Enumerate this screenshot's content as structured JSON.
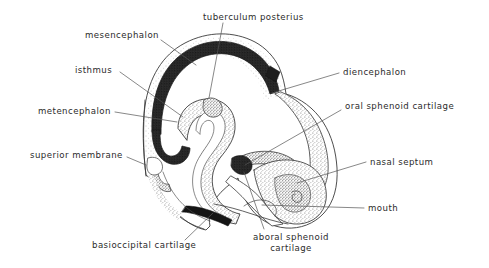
{
  "figure": {
    "background_color": "#ffffff",
    "ink_color": "#2b2b2b",
    "leader_line_color": "#555555"
  },
  "labels": [
    {
      "id": "mesencephalon",
      "text": "mesencephalon",
      "side": "left",
      "x": 85,
      "y": 30,
      "leader": [
        [
          161,
          40
        ],
        [
          196,
          65
        ]
      ]
    },
    {
      "id": "tuberculum-posterius",
      "text": "tuberculum posterius",
      "side": "top",
      "x": 203,
      "y": 12,
      "leader": [
        [
          223,
          23
        ],
        [
          209,
          98
        ]
      ]
    },
    {
      "id": "isthmus",
      "text": "isthmus",
      "side": "left",
      "x": 75,
      "y": 65,
      "leader": [
        [
          120,
          72
        ],
        [
          183,
          117
        ]
      ]
    },
    {
      "id": "diencephalon",
      "text": "diencephalon",
      "side": "right",
      "x": 343,
      "y": 67,
      "leader": [
        [
          339,
          73
        ],
        [
          272,
          93
        ]
      ]
    },
    {
      "id": "metencephalon",
      "text": "metencephalon",
      "side": "left",
      "x": 38,
      "y": 106,
      "leader": [
        [
          115,
          112
        ],
        [
          177,
          122
        ]
      ]
    },
    {
      "id": "oral-sphenoid-cartilage",
      "text": "oral sphenoid cartilage",
      "side": "right",
      "x": 345,
      "y": 101,
      "leader": [
        [
          341,
          110
        ],
        [
          245,
          165
        ]
      ]
    },
    {
      "id": "superior-membrane",
      "text": "superior membrane",
      "side": "left",
      "x": 30,
      "y": 150,
      "leader": [
        [
          127,
          157
        ],
        [
          146,
          165
        ]
      ]
    },
    {
      "id": "nasal-septum",
      "text": "nasal septum",
      "side": "right",
      "x": 370,
      "y": 157,
      "leader": [
        [
          366,
          162
        ],
        [
          297,
          163
        ]
      ]
    },
    {
      "id": "mouth",
      "text": "mouth",
      "side": "right",
      "x": 368,
      "y": 203,
      "leader": [
        [
          364,
          208
        ],
        [
          262,
          205
        ]
      ]
    },
    {
      "id": "basioccipital-cartilage",
      "text": "basioccipital cartilage",
      "side": "bottom",
      "x": 92,
      "y": 240,
      "leader": [
        [
          185,
          240
        ],
        [
          213,
          213
        ]
      ]
    },
    {
      "id": "aboral-sphenoid-cartilage",
      "text": "aboral sphenoid cartilage",
      "side": "bottom",
      "x": 243,
      "y": 232,
      "leader": [
        [
          264,
          229
        ],
        [
          244,
          166
        ]
      ]
    }
  ],
  "structures": [
    {
      "id": "outer-head-outline",
      "name": "outer head outline"
    },
    {
      "id": "dorsal-neural-band",
      "name": "dark dorsal neural band"
    },
    {
      "id": "neural-tube-lumen",
      "name": "neural tube lumen"
    },
    {
      "id": "diencephalon-region",
      "name": "diencephalon stippled region"
    },
    {
      "id": "nasal-septum-region",
      "name": "nasal septum stippled cartilage"
    },
    {
      "id": "oral-sphenoid-region",
      "name": "oral sphenoid cartilage"
    },
    {
      "id": "basioccipital-bar",
      "name": "basioccipital cartilage dark bar"
    },
    {
      "id": "mouth-cavity",
      "name": "mouth cavity"
    }
  ]
}
